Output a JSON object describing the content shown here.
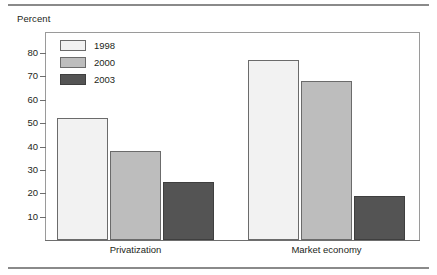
{
  "figure": {
    "y_axis_title": "Percent"
  },
  "chart_data": {
    "type": "bar",
    "title": "",
    "xlabel": "",
    "ylabel": "Percent",
    "ylim": [
      0,
      85
    ],
    "yticks": [
      10,
      20,
      30,
      40,
      50,
      60,
      70,
      80
    ],
    "grid": false,
    "legend_position": "top-left",
    "categories": [
      "Privatization",
      "Market economy"
    ],
    "series": [
      {
        "name": "1998",
        "color": "#f2f2f2",
        "values": [
          52,
          77
        ]
      },
      {
        "name": "2000",
        "color": "#bdbdbd",
        "values": [
          38,
          68
        ]
      },
      {
        "name": "2003",
        "color": "#545454",
        "values": [
          25,
          19
        ]
      }
    ]
  }
}
